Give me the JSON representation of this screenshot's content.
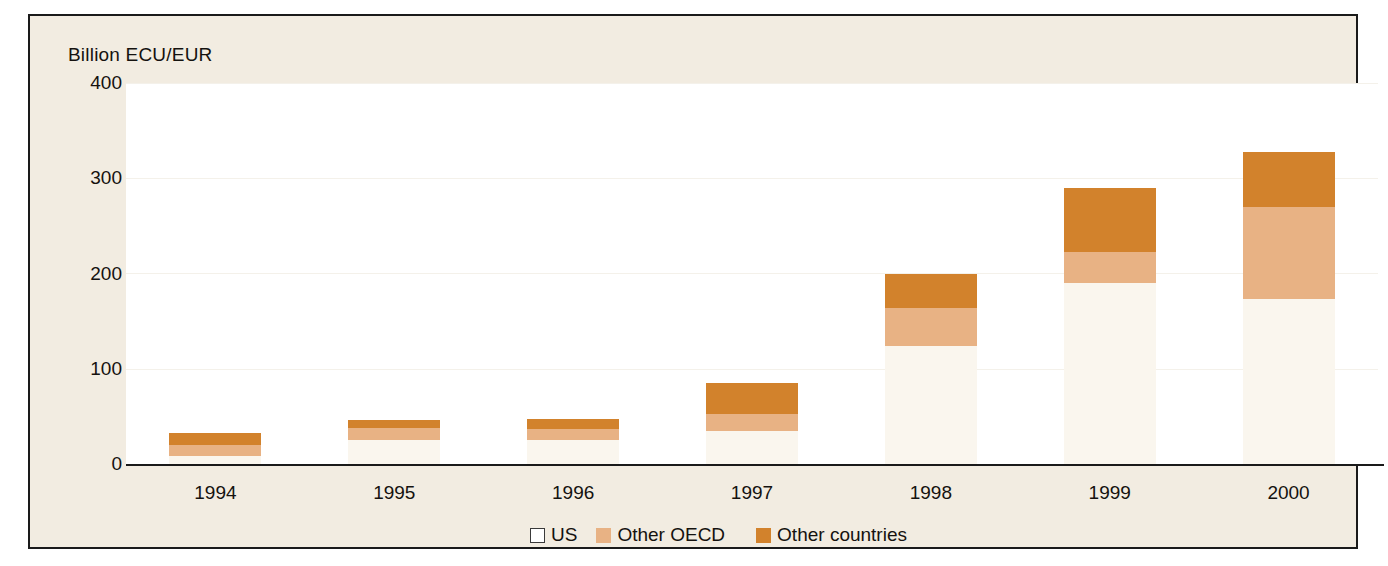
{
  "chart_data": {
    "type": "bar",
    "stacked": true,
    "title": "",
    "subtitle": "",
    "xlabel": "",
    "ylabel": "Billion ECU/EUR",
    "categories": [
      "1994",
      "1995",
      "1996",
      "1997",
      "1998",
      "1999",
      "2000"
    ],
    "ylim": [
      0,
      400
    ],
    "yticks": [
      "0",
      "100",
      "200",
      "300",
      "400"
    ],
    "ytick_values": [
      0,
      100,
      200,
      300,
      400
    ],
    "grid": false,
    "legend_position": "bottom",
    "series": [
      {
        "name": "US",
        "color": "#faf6ee",
        "values": [
          8,
          25,
          25,
          35,
          124,
          190,
          173
        ]
      },
      {
        "name": "Other OECD",
        "color": "#e8b284",
        "values": [
          12,
          13,
          12,
          17,
          40,
          33,
          97
        ]
      },
      {
        "name": "Other countries",
        "color": "#d2822c",
        "values": [
          13,
          8,
          10,
          33,
          36,
          67,
          58
        ]
      }
    ],
    "totals": [
      33,
      46,
      47,
      85,
      200,
      290,
      328
    ],
    "annotations": []
  },
  "axis": {
    "y_title": "Billion ECU/EUR"
  },
  "legend": {
    "items": [
      {
        "label": "US",
        "swatch": "us-swatch"
      },
      {
        "label": "Other OECD",
        "swatch": "other-oecd-swatch"
      },
      {
        "label": "Other countries",
        "swatch": "other-countries-swatch"
      }
    ]
  },
  "colors": {
    "us": "#faf6ee",
    "other_oecd": "#e8b284",
    "other_countries": "#d2822c",
    "background": "#f2ece1",
    "plot_background": "#ffffff",
    "axis": "#1a1a1a",
    "text": "#15120f"
  }
}
